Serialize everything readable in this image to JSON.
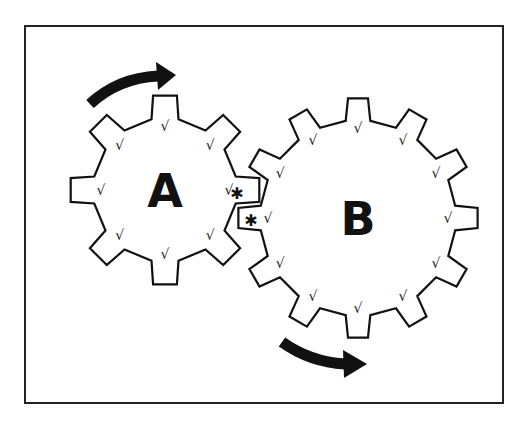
{
  "diagram": {
    "type": "gear-train",
    "frame": {
      "x": 25,
      "y": 26,
      "width": 478,
      "height": 377,
      "stroke": "#222222"
    },
    "gears": [
      {
        "id": "A",
        "label": "A",
        "teeth": 8,
        "cx": 165,
        "cy": 190,
        "outer_r": 95,
        "inner_r": 72,
        "rotation_deg": -90,
        "label_size": 46,
        "tick_mark": "√"
      },
      {
        "id": "B",
        "label": "B",
        "teeth": 12,
        "cx": 358,
        "cy": 218,
        "outer_r": 120,
        "inner_r": 98,
        "rotation_deg": -90,
        "label_size": 46,
        "tick_mark": "√"
      }
    ],
    "contact_markers": [
      {
        "symbol": "✱",
        "x": 237,
        "y": 199
      },
      {
        "symbol": "✱",
        "x": 251,
        "y": 226
      }
    ],
    "arrows": [
      {
        "name": "gear-a-clockwise-arrow",
        "direction": "clockwise",
        "gear": "A"
      },
      {
        "name": "gear-b-counterclockwise-arrow",
        "direction": "counterclockwise",
        "gear": "B"
      }
    ],
    "colors": {
      "ink": "#111111",
      "background": "#ffffff"
    }
  }
}
